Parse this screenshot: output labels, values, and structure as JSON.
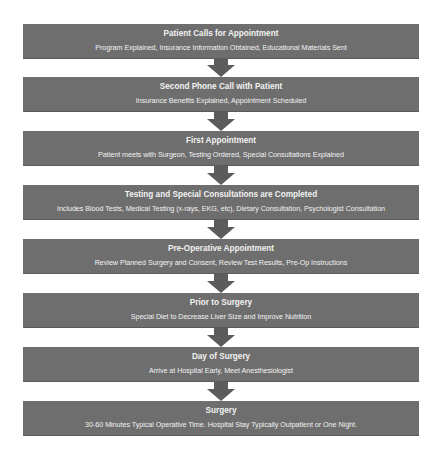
{
  "diagram": {
    "type": "vertical-flowchart",
    "colors": {
      "box_fill": "#6e6e6e",
      "box_text": "#f2f2f2",
      "arrow_fill": "#5c5c5c",
      "background": "#ffffff"
    },
    "steps": [
      {
        "title": "Patient Calls for Appointment",
        "description": "Program Explained, Insurance Information Obtained, Educational Materials Sent"
      },
      {
        "title": "Second Phone Call with Patient",
        "description": "Insurance Benefits Explained, Appointment Scheduled"
      },
      {
        "title": "First Appointment",
        "description": "Patient meets with Surgeon, Testing Ordered, Special Consultations Explained"
      },
      {
        "title": "Testing and Special Consultations are Completed",
        "description": "Includes Blood Tests, Medical Testing (x-rays, EKG, etc), Dietary Consultation, Psychologist Consultation"
      },
      {
        "title": "Pre-Operative Appointment",
        "description": "Review Planned Surgery and Consent, Review Test Results, Pre-Op Instructions"
      },
      {
        "title": "Prior to Surgery",
        "description": "Special Diet to Decrease Liver Size and Improve Nutrition"
      },
      {
        "title": "Day of Surgery",
        "description": "Arrive at Hospital Early, Meet Anesthesiologist"
      },
      {
        "title": "Surgery",
        "description": "30-60 Minutes Typical Operative Time. Hospital Stay Typically Outpatient or One Night."
      }
    ],
    "connectors": [
      {
        "from": 0,
        "to": 1,
        "icon": "down-arrow-icon"
      },
      {
        "from": 1,
        "to": 2,
        "icon": "down-arrow-icon"
      },
      {
        "from": 2,
        "to": 3,
        "icon": "down-arrow-icon"
      },
      {
        "from": 3,
        "to": 4,
        "icon": "down-arrow-icon"
      },
      {
        "from": 4,
        "to": 5,
        "icon": "down-arrow-icon"
      },
      {
        "from": 5,
        "to": 6,
        "icon": "down-arrow-icon"
      },
      {
        "from": 6,
        "to": 7,
        "icon": "down-arrow-icon"
      }
    ]
  }
}
